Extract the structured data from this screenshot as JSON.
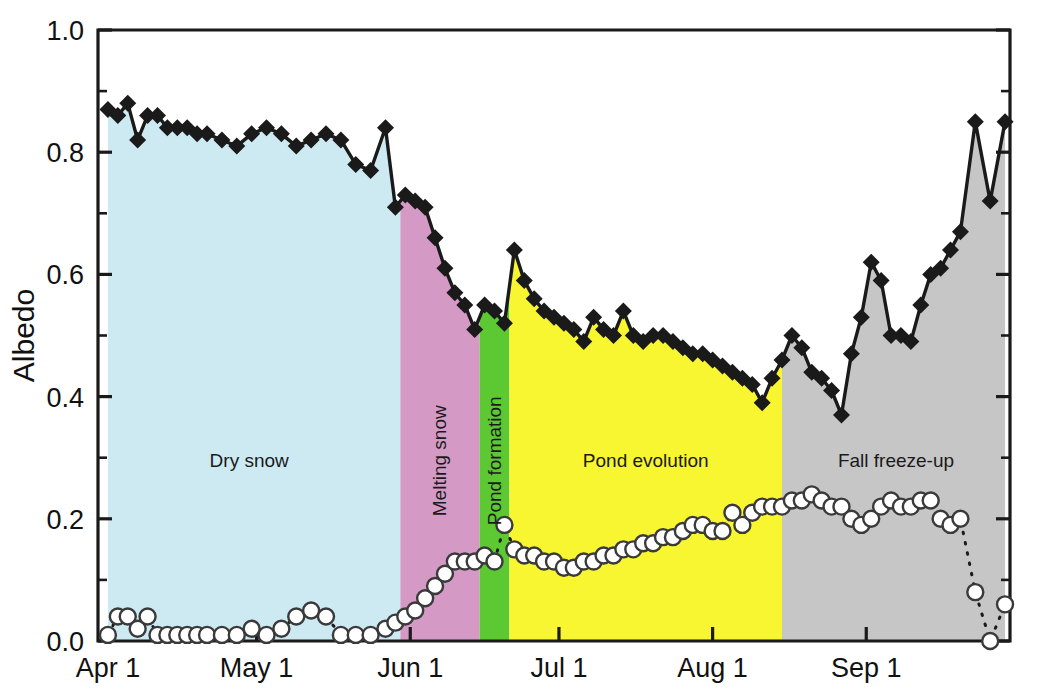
{
  "chart_data": {
    "type": "line",
    "title": "",
    "xlabel": "",
    "ylabel": "Albedo",
    "ylim": [
      0.0,
      1.0
    ],
    "ytick_labels": [
      "0.0",
      "0.2",
      "0.4",
      "0.6",
      "0.8",
      "1.0"
    ],
    "ytick_values": [
      0.0,
      0.2,
      0.4,
      0.6,
      0.8,
      1.0
    ],
    "yminor_values": [
      0.1,
      0.3,
      0.5,
      0.7,
      0.9
    ],
    "xtick_labels": [
      "Apr 1",
      "May 1",
      "Jun 1",
      "Jul 1",
      "Aug 1",
      "Sep 1"
    ],
    "xtick_days": [
      0,
      30,
      61,
      91,
      122,
      153
    ],
    "xlim_days": [
      -2,
      182
    ],
    "grid": false,
    "legend_position": "none",
    "series": [
      {
        "name": "Albedo",
        "marker": "filled-diamond",
        "line_style": "solid",
        "fill": "region-bands",
        "color": "#1a1a1a",
        "x_days": [
          0,
          2,
          4,
          6,
          8,
          10,
          12,
          14,
          16,
          18,
          20,
          23,
          26,
          29,
          32,
          35,
          38,
          41,
          44,
          47,
          50,
          53,
          56,
          58,
          60,
          62,
          64,
          66,
          68,
          70,
          72,
          74,
          76,
          78,
          80,
          82,
          84,
          86,
          88,
          90,
          92,
          94,
          96,
          98,
          100,
          102,
          104,
          106,
          108,
          110,
          112,
          114,
          116,
          118,
          120,
          122,
          124,
          126,
          128,
          130,
          132,
          134,
          136,
          138,
          140,
          142,
          144,
          146,
          148,
          150,
          152,
          154,
          156,
          158,
          160,
          162,
          164,
          166,
          168,
          170,
          172,
          175,
          178,
          181
        ],
        "values": [
          0.87,
          0.86,
          0.88,
          0.82,
          0.86,
          0.86,
          0.84,
          0.84,
          0.84,
          0.83,
          0.83,
          0.82,
          0.81,
          0.83,
          0.84,
          0.83,
          0.81,
          0.82,
          0.83,
          0.82,
          0.78,
          0.77,
          0.84,
          0.71,
          0.73,
          0.72,
          0.71,
          0.66,
          0.61,
          0.57,
          0.55,
          0.51,
          0.55,
          0.54,
          0.52,
          0.64,
          0.59,
          0.56,
          0.54,
          0.53,
          0.52,
          0.51,
          0.49,
          0.53,
          0.51,
          0.5,
          0.54,
          0.5,
          0.49,
          0.5,
          0.5,
          0.49,
          0.48,
          0.47,
          0.47,
          0.46,
          0.45,
          0.44,
          0.43,
          0.42,
          0.39,
          0.43,
          0.46,
          0.5,
          0.48,
          0.44,
          0.43,
          0.41,
          0.37,
          0.47,
          0.53,
          0.62,
          0.59,
          0.5,
          0.5,
          0.49,
          0.55,
          0.6,
          0.61,
          0.64,
          0.67,
          0.85,
          0.72,
          0.85
        ]
      },
      {
        "name": "Pond fraction",
        "marker": "open-circle",
        "line_style": "dotted",
        "color": "#1a1a1a",
        "x_days": [
          0,
          2,
          4,
          6,
          8,
          10,
          12,
          14,
          16,
          18,
          20,
          23,
          26,
          29,
          32,
          35,
          38,
          41,
          44,
          47,
          50,
          53,
          56,
          58,
          60,
          62,
          64,
          66,
          68,
          70,
          72,
          74,
          76,
          78,
          80,
          82,
          84,
          86,
          88,
          90,
          92,
          94,
          96,
          98,
          100,
          102,
          104,
          106,
          108,
          110,
          112,
          114,
          116,
          118,
          120,
          122,
          124,
          126,
          128,
          130,
          132,
          134,
          136,
          138,
          140,
          142,
          144,
          146,
          148,
          150,
          152,
          154,
          156,
          158,
          160,
          162,
          164,
          166,
          168,
          170,
          172,
          175,
          178,
          181
        ],
        "values": [
          0.01,
          0.04,
          0.04,
          0.02,
          0.04,
          0.01,
          0.01,
          0.01,
          0.01,
          0.01,
          0.01,
          0.01,
          0.01,
          0.02,
          0.01,
          0.02,
          0.04,
          0.05,
          0.04,
          0.01,
          0.01,
          0.01,
          0.02,
          0.03,
          0.04,
          0.05,
          0.07,
          0.09,
          0.11,
          0.13,
          0.13,
          0.13,
          0.14,
          0.13,
          0.19,
          0.15,
          0.14,
          0.14,
          0.13,
          0.13,
          0.12,
          0.12,
          0.13,
          0.13,
          0.14,
          0.14,
          0.15,
          0.15,
          0.16,
          0.16,
          0.17,
          0.17,
          0.18,
          0.19,
          0.19,
          0.18,
          0.18,
          0.21,
          0.19,
          0.21,
          0.22,
          0.22,
          0.22,
          0.23,
          0.23,
          0.24,
          0.23,
          0.22,
          0.22,
          0.2,
          0.19,
          0.2,
          0.22,
          0.23,
          0.22,
          0.22,
          0.23,
          0.23,
          0.2,
          0.19,
          0.2,
          0.08,
          0.0,
          0.06
        ]
      }
    ],
    "regions": [
      {
        "label": "Dry snow",
        "start_day": -2,
        "end_day": 59,
        "color": "#cdeaf3",
        "orientation": "horizontal",
        "label_y": 0.295
      },
      {
        "label": "Melting snow",
        "start_day": 59,
        "end_day": 75,
        "color": "#d49ac5",
        "orientation": "vertical",
        "label_y": 0.295
      },
      {
        "label": "Pond formation",
        "start_day": 75,
        "end_day": 81,
        "color": "#5cc832",
        "orientation": "vertical",
        "label_y": 0.295
      },
      {
        "label": "Pond evolution",
        "start_day": 81,
        "end_day": 136,
        "color": "#f8f531",
        "orientation": "horizontal",
        "label_y": 0.295
      },
      {
        "label": "Fall freeze-up",
        "start_day": 136,
        "end_day": 182,
        "color": "#c6c6c6",
        "orientation": "horizontal",
        "label_y": 0.295
      }
    ]
  }
}
